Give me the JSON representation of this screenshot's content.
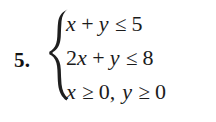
{
  "exercise": {
    "number_label": "5.",
    "brace": "left-curly-brace",
    "system": {
      "lines": [
        {
          "id": "constraint-1",
          "text": "x + y ≤ 5",
          "lhs": "x + y",
          "relation": "≤",
          "rhs": "5",
          "tokens": [
            {
              "kind": "var",
              "text": "x"
            },
            {
              "kind": "op",
              "text": "+"
            },
            {
              "kind": "var",
              "text": "y"
            },
            {
              "kind": "rel",
              "text": "≤"
            },
            {
              "kind": "num",
              "text": "5"
            }
          ]
        },
        {
          "id": "constraint-2",
          "text": "2x + y ≤ 8",
          "lhs": "2x + y",
          "relation": "≤",
          "rhs": "8",
          "tokens": [
            {
              "kind": "coef",
              "text": "2"
            },
            {
              "kind": "var",
              "text": "x"
            },
            {
              "kind": "op",
              "text": "+"
            },
            {
              "kind": "var",
              "text": "y"
            },
            {
              "kind": "rel",
              "text": "≤"
            },
            {
              "kind": "num",
              "text": "8"
            }
          ]
        },
        {
          "id": "constraint-3",
          "text": "x ≥ 0, y ≥ 0",
          "lhs": "x ≥ 0",
          "relation": "≥",
          "rhs": "0",
          "tokens": [
            {
              "kind": "var",
              "text": "x"
            },
            {
              "kind": "rel",
              "text": "≥"
            },
            {
              "kind": "num",
              "text": "0"
            },
            {
              "kind": "comma",
              "text": ","
            },
            {
              "kind": "var",
              "text": "y"
            },
            {
              "kind": "rel",
              "text": "≥"
            },
            {
              "kind": "num",
              "text": "0"
            }
          ]
        }
      ]
    }
  },
  "style": {
    "background_color": "#ffffff",
    "text_color": "#1b1b1b",
    "number_color": "#131313"
  }
}
